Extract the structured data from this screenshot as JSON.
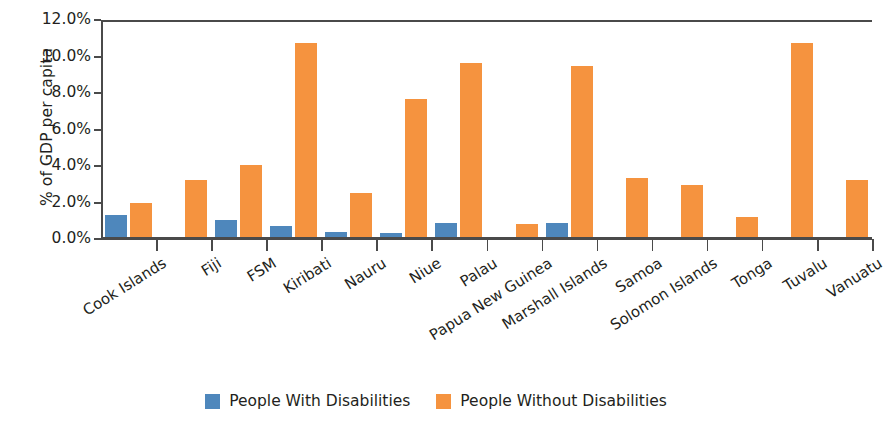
{
  "chart_data": {
    "type": "bar",
    "title": "",
    "xlabel": "",
    "ylabel": "% of GDP per capita",
    "ylim": [
      0,
      12
    ],
    "ytick_labels": [
      "12.0%",
      "10.0%",
      "8.0%",
      "6.0%",
      "4.0%",
      "2.0%",
      "0.0%"
    ],
    "ytick_values": [
      12,
      10,
      8,
      6,
      4,
      2,
      0
    ],
    "grid": false,
    "legend_position": "bottom-center",
    "categories": [
      "Cook Islands",
      "Fiji",
      "FSM",
      "Kiribati",
      "Nauru",
      "Niue",
      "Palau",
      "Papua New Guinea",
      "Marshall Islands",
      "Samoa",
      "Solomon Islands",
      "Tonga",
      "Tuvalu",
      "Vanuatu"
    ],
    "series": [
      {
        "name": "People With Disabilities",
        "color": "#4e87bc",
        "values": [
          1.3,
          0.0,
          1.05,
          0.7,
          0.4,
          0.35,
          0.9,
          0.0,
          0.9,
          0.0,
          0.0,
          0.1,
          0.0,
          0.0
        ]
      },
      {
        "name": "People Without Disabilities",
        "color": "#f5933f",
        "values": [
          2.0,
          3.25,
          4.05,
          10.75,
          2.5,
          7.65,
          9.65,
          0.85,
          9.5,
          3.35,
          2.95,
          1.2,
          10.75,
          3.25
        ]
      }
    ]
  },
  "legend": {
    "items": [
      {
        "label": "People With Disabilities",
        "swatch": "with"
      },
      {
        "label": "People Without Disabilities",
        "swatch": "without"
      }
    ]
  },
  "colors": {
    "with_disabilities": "#4e87bc",
    "without_disabilities": "#f5933f",
    "axis": "#4a4a4a",
    "text": "#231f20",
    "background": "#ffffff"
  }
}
